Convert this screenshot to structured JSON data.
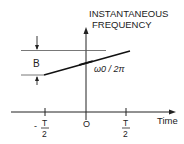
{
  "diagram": {
    "y_axis_label_line1": "INSTANTANEOUS",
    "y_axis_label_line2": "FREQUENCY",
    "x_axis_label": "Time",
    "bandwidth_label": "B",
    "center_freq_label": "ω0 / 2π",
    "ticks": {
      "left_num": "T",
      "left_sign": "-",
      "left_den": "2",
      "center": "O",
      "right_num": "T",
      "right_den": "2"
    }
  }
}
